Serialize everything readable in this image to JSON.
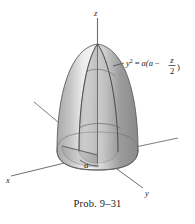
{
  "figure": {
    "caption": "Prob. 9–31",
    "background_color": "#ffffff",
    "axes": {
      "z_label": "z",
      "x_label": "x",
      "y_label": "y",
      "axis_color": "#6e6e6e"
    },
    "dimension": {
      "radius_label": "a"
    },
    "equation": {
      "lhs_var": "y",
      "lhs_exponent": "2",
      "equals": "=",
      "rhs_open": "a(a",
      "minus": "−",
      "frac_numerator": "z",
      "frac_denominator": "2",
      "rhs_close": ")",
      "plain": "y² = a(a − z/2)"
    },
    "solid": {
      "shape_name": "paraboloid-of-revolution",
      "fill_light": "#e8e8e8",
      "fill_mid": "#b9b9b9",
      "fill_dark": "#8a8a8a",
      "outline_color": "#5d5d5d"
    }
  }
}
